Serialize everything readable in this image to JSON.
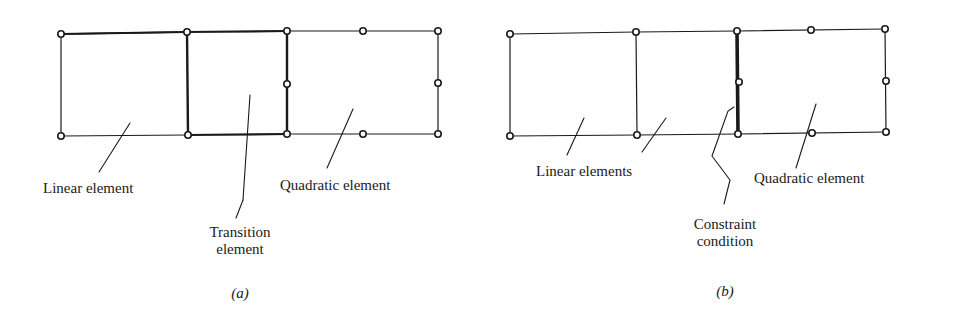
{
  "figure_a": {
    "caption": "(a)",
    "labels": {
      "linear": "Linear element",
      "transition_line1": "Transition",
      "transition_line2": "element",
      "quadratic": "Quadratic element"
    }
  },
  "figure_b": {
    "caption": "(b)",
    "labels": {
      "linear": "Linear elements",
      "constraint_line1": "Constraint",
      "constraint_line2": "condition",
      "quadratic": "Quadratic element"
    }
  },
  "colors": {
    "stroke": "#1a1a1a",
    "background": "#ffffff"
  }
}
